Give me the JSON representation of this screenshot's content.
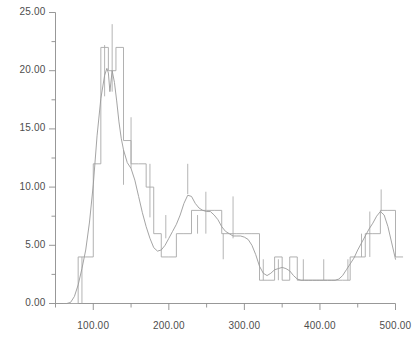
{
  "chart_data": {
    "type": "line",
    "title": "",
    "subtitle": "",
    "xlabel": "",
    "ylabel": "",
    "xlim": [
      50,
      500
    ],
    "ylim": [
      0,
      25
    ],
    "grid": false,
    "legend": null,
    "legend_position": "none",
    "x_ticks_major": [
      100,
      200,
      300,
      400,
      500
    ],
    "x_tick_labels": [
      "100.00",
      "200.00",
      "300.00",
      "400.00",
      "500.00"
    ],
    "x_ticks_minor": [
      50,
      150,
      250,
      350,
      450
    ],
    "y_ticks_major": [
      0,
      5,
      10,
      15,
      20,
      25
    ],
    "y_tick_labels": [
      "0.00",
      "5.00",
      "10.00",
      "15.00",
      "20.00",
      "25.00"
    ],
    "y_ticks_minor": [
      2.5,
      7.5,
      12.5,
      17.5,
      22.5
    ],
    "colors": {
      "step_trace": "#a8a8a8",
      "smooth_trace": "#9a9a9a",
      "axis": "#8c8c8c",
      "text": "#4d4d4d",
      "background": "#ffffff"
    },
    "series": [
      {
        "name": "step-histogram",
        "style": "step",
        "bin_edges": [
          60,
          70,
          80,
          90,
          100,
          110,
          120,
          130,
          140,
          150,
          160,
          170,
          180,
          190,
          200,
          210,
          220,
          230,
          240,
          250,
          260,
          270,
          280,
          290,
          300,
          310,
          320,
          330,
          340,
          350,
          360,
          370,
          380,
          390,
          400,
          410,
          420,
          430,
          440,
          450,
          460,
          470,
          480,
          490,
          500
        ],
        "values": [
          0.0,
          0.0,
          4.0,
          4.0,
          12.0,
          22.0,
          20.0,
          22.0,
          14.0,
          12.0,
          12.0,
          10.0,
          6.0,
          4.0,
          4.0,
          6.0,
          6.0,
          8.0,
          8.0,
          8.0,
          8.0,
          6.0,
          6.0,
          6.0,
          6.0,
          6.0,
          2.0,
          2.0,
          4.0,
          2.0,
          4.0,
          2.0,
          2.0,
          2.0,
          2.0,
          2.0,
          2.0,
          2.0,
          4.0,
          4.0,
          6.0,
          6.0,
          8.0,
          8.0,
          4.0
        ]
      },
      {
        "name": "smooth-curve",
        "style": "line",
        "x": [
          60,
          65,
          70,
          75,
          80,
          85,
          90,
          95,
          100,
          105,
          110,
          115,
          118,
          120,
          122,
          125,
          128,
          131,
          134,
          137,
          140,
          145,
          150,
          155,
          160,
          165,
          170,
          175,
          180,
          185,
          190,
          195,
          200,
          205,
          210,
          215,
          220,
          225,
          230,
          235,
          240,
          245,
          250,
          255,
          260,
          265,
          270,
          275,
          280,
          285,
          290,
          295,
          300,
          305,
          310,
          315,
          320,
          325,
          330,
          335,
          340,
          345,
          350,
          355,
          360,
          365,
          370,
          375,
          380,
          385,
          390,
          395,
          400,
          405,
          410,
          415,
          420,
          425,
          430,
          435,
          440,
          445,
          450,
          455,
          460,
          465,
          470,
          475,
          480,
          485,
          490,
          495,
          500
        ],
        "values": [
          0.0,
          0.0,
          0.1,
          0.6,
          1.6,
          3.0,
          4.6,
          7.0,
          10.2,
          14.4,
          17.6,
          19.6,
          20.2,
          19.8,
          18.2,
          20.0,
          19.0,
          17.4,
          15.6,
          14.2,
          13.2,
          12.1,
          11.6,
          10.6,
          9.2,
          7.8,
          6.6,
          5.6,
          4.8,
          4.5,
          4.6,
          5.0,
          5.6,
          6.2,
          6.8,
          7.6,
          8.6,
          9.3,
          9.2,
          8.6,
          8.2,
          8.0,
          7.9,
          7.9,
          7.6,
          7.2,
          6.6,
          6.2,
          6.0,
          5.8,
          5.8,
          5.8,
          5.7,
          5.5,
          5.0,
          4.2,
          3.2,
          2.6,
          2.4,
          2.6,
          2.9,
          3.0,
          3.1,
          3.0,
          2.8,
          2.4,
          2.1,
          2.0,
          2.0,
          2.0,
          2.0,
          2.0,
          2.0,
          2.0,
          2.0,
          2.0,
          2.0,
          2.1,
          2.4,
          2.9,
          3.4,
          3.9,
          4.6,
          5.2,
          5.8,
          6.4,
          6.9,
          7.5,
          7.9,
          7.6,
          6.6,
          5.2,
          3.8
        ]
      },
      {
        "name": "error-spikes",
        "style": "vertical-bars",
        "points": [
          {
            "x": 85,
            "low": 0.0,
            "high": 4.0
          },
          {
            "x": 115,
            "low": 17.8,
            "high": 22.2
          },
          {
            "x": 125,
            "low": 18.2,
            "high": 24.0
          },
          {
            "x": 140,
            "low": 10.2,
            "high": 13.2
          },
          {
            "x": 150,
            "low": 11.6,
            "high": 16.0
          },
          {
            "x": 175,
            "low": 7.4,
            "high": 12.0
          },
          {
            "x": 196,
            "low": 5.6,
            "high": 7.6
          },
          {
            "x": 225,
            "low": 9.4,
            "high": 12.0
          },
          {
            "x": 238,
            "low": 6.0,
            "high": 7.6
          },
          {
            "x": 249,
            "low": 6.0,
            "high": 9.6
          },
          {
            "x": 272,
            "low": 3.8,
            "high": 6.0
          },
          {
            "x": 285,
            "low": 5.6,
            "high": 9.2
          },
          {
            "x": 325,
            "low": 2.0,
            "high": 3.8
          },
          {
            "x": 345,
            "low": 2.0,
            "high": 3.8
          },
          {
            "x": 378,
            "low": 2.0,
            "high": 3.8
          },
          {
            "x": 405,
            "low": 2.0,
            "high": 3.8
          },
          {
            "x": 437,
            "low": 2.0,
            "high": 3.8
          },
          {
            "x": 455,
            "low": 4.0,
            "high": 6.0
          },
          {
            "x": 466,
            "low": 4.0,
            "high": 7.9
          },
          {
            "x": 481,
            "low": 7.9,
            "high": 9.8
          }
        ]
      }
    ]
  }
}
